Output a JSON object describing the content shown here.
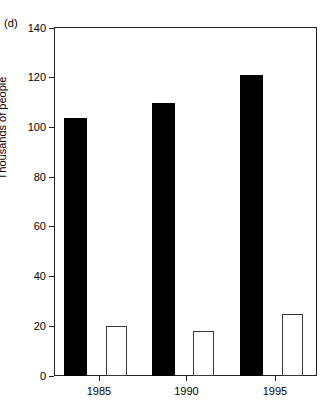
{
  "panel": {
    "label": "(d)"
  },
  "chart_data": {
    "type": "bar",
    "title": "",
    "subtitle": "",
    "xlabel": "",
    "ylabel": "Thousands of people",
    "categories": [
      "1985",
      "1990",
      "1995"
    ],
    "series": [
      {
        "name": "filled",
        "fill": "#000000",
        "values": [
          104,
          110,
          121
        ]
      },
      {
        "name": "open",
        "fill": "#ffffff",
        "values": [
          20,
          18,
          25
        ]
      }
    ],
    "ylim": [
      0,
      140
    ],
    "yticks": [
      0,
      20,
      40,
      60,
      80,
      100,
      120,
      140
    ],
    "ytick_labels": [
      "0",
      "20",
      "40",
      "60",
      "80",
      "100",
      "120",
      "140"
    ],
    "xtick_labels": [
      "1985",
      "1990",
      "1995"
    ],
    "grid": false,
    "legend": "none",
    "frame": "box",
    "colors": {
      "axis": "#222222",
      "filled_bar": "#000000",
      "open_bar_edge": "#3a3a3a",
      "open_bar_face": "#ffffff",
      "background": "#ffffff"
    }
  }
}
